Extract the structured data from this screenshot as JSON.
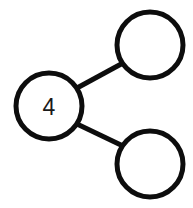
{
  "diagram": {
    "type": "node-link-tree",
    "title": "",
    "background_color": "#ffffff",
    "stroke_color": "#0d0d0d",
    "label_color": "#1a1a1a",
    "stroke_width": 5,
    "node_radius": 33,
    "nodes": [
      {
        "id": "root",
        "label": "4",
        "cx": 49,
        "cy": 106,
        "r": 33,
        "role": "root-node"
      },
      {
        "id": "child-top",
        "label": "",
        "cx": 150,
        "cy": 45,
        "r": 33,
        "role": "child-node-top"
      },
      {
        "id": "child-bottom",
        "label": "",
        "cx": 150,
        "cy": 164,
        "r": 33,
        "role": "child-node-bottom"
      }
    ],
    "edges": [
      {
        "id": "edge-root-top",
        "from": "root",
        "to": "child-top",
        "x1": 77,
        "y1": 88,
        "x2": 123,
        "y2": 63
      },
      {
        "id": "edge-root-bottom",
        "from": "root",
        "to": "child-bottom",
        "x1": 77,
        "y1": 124,
        "x2": 123,
        "y2": 146
      }
    ]
  }
}
